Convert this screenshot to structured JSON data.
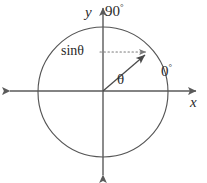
{
  "figure": {
    "colors": {
      "stroke": "#5a5a5a",
      "circle": "#555555",
      "text": "#2b2b2b",
      "dotted": "#7a7a7a",
      "background": "#ffffff"
    },
    "geometry": {
      "center_x": 103,
      "center_y": 92,
      "radius": 65,
      "angle_degrees": 41,
      "terminal_x": 152,
      "terminal_y": 49,
      "x_axis_y": 91,
      "y_axis_x": 103,
      "x_axis_left": 5,
      "x_axis_right": 201,
      "y_axis_top": 3,
      "y_axis_bottom": 180,
      "sin_line_y": 52
    },
    "labels": {
      "y_axis": "y",
      "x_axis": "x",
      "angle_90": "90",
      "angle_0": "0",
      "degree_symbol": "°",
      "sine": "sinθ",
      "theta": "θ"
    }
  }
}
